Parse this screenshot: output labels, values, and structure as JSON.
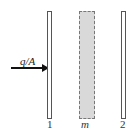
{
  "diagram": {
    "flux": {
      "label": "q/A",
      "direction": "right"
    },
    "elements": [
      {
        "id": "plate-1",
        "type": "plate",
        "label": "1"
      },
      {
        "id": "shield-m",
        "type": "radiation-shield",
        "label": "m"
      },
      {
        "id": "plate-2",
        "type": "plate",
        "label": "2"
      }
    ],
    "colors": {
      "shield_fill": "#d9d9d9",
      "plate_border": "#555555",
      "arrow": "#111111"
    }
  }
}
